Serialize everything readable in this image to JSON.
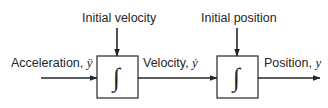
{
  "diagram": {
    "type": "block-diagram",
    "colors": {
      "stroke": "#262626",
      "text": "#262626",
      "background": "#ffffff"
    },
    "input": {
      "label": "Acceleration, ",
      "symbol": "ÿ"
    },
    "blocks": [
      {
        "id": "integrator-1",
        "symbol": "∫",
        "initial_condition_label": "Initial velocity"
      },
      {
        "id": "integrator-2",
        "symbol": "∫",
        "initial_condition_label": "Initial position"
      }
    ],
    "intermediate": {
      "label": "Velocity, ",
      "symbol": "ẏ"
    },
    "output": {
      "label": "Position, ",
      "symbol": "y"
    }
  }
}
